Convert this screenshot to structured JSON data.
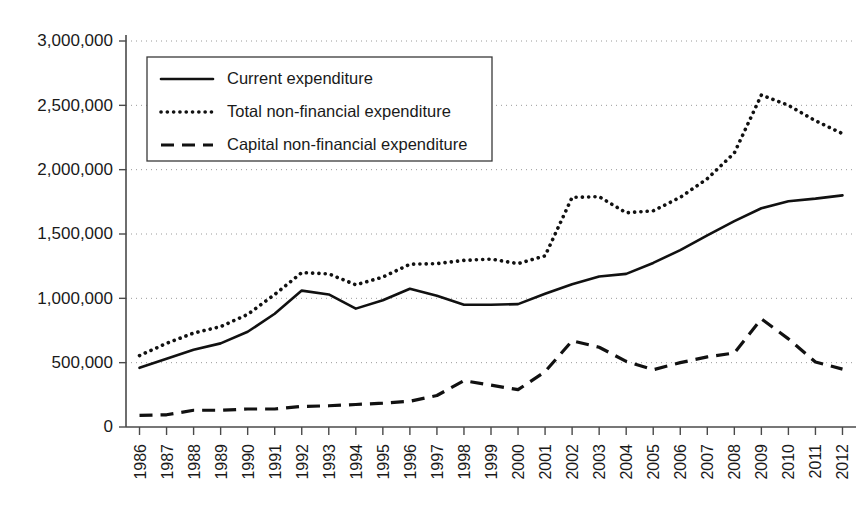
{
  "chart_data": {
    "type": "line",
    "title": "",
    "xlabel": "",
    "ylabel": "",
    "ylim": [
      0,
      3000000
    ],
    "grid": true,
    "legend_position": "top-left",
    "categories": [
      "1986",
      "1987",
      "1988",
      "1989",
      "1990",
      "1991",
      "1992",
      "1993",
      "1994",
      "1995",
      "1996",
      "1997",
      "1998",
      "1999",
      "2000",
      "2001",
      "2002",
      "2003",
      "2004",
      "2005",
      "2006",
      "2007",
      "2008",
      "2009",
      "2010",
      "2011",
      "2012"
    ],
    "ytick_labels": [
      "0",
      "500,000",
      "1,000,000",
      "1,500,000",
      "2,000,000",
      "2,500,000",
      "3,000,000"
    ],
    "ytick_values": [
      0,
      500000,
      1000000,
      1500000,
      2000000,
      2500000,
      3000000
    ],
    "series": [
      {
        "name": "Current expenditure",
        "style": "solid",
        "values": [
          460000,
          530000,
          600000,
          650000,
          740000,
          880000,
          1060000,
          1030000,
          920000,
          985000,
          1075000,
          1020000,
          950000,
          950000,
          955000,
          1035000,
          1110000,
          1170000,
          1190000,
          1275000,
          1375000,
          1490000,
          1600000,
          1700000,
          1755000,
          1775000,
          1800000
        ]
      },
      {
        "name": "Total non-financial expenditure",
        "style": "dotted",
        "values": [
          555000,
          650000,
          730000,
          780000,
          875000,
          1030000,
          1200000,
          1190000,
          1105000,
          1165000,
          1265000,
          1270000,
          1295000,
          1305000,
          1270000,
          1330000,
          1785000,
          1790000,
          1665000,
          1680000,
          1785000,
          1930000,
          2130000,
          2580000,
          2500000,
          2380000,
          2280000
        ]
      },
      {
        "name": "Capital non-financial expenditure",
        "style": "dashed",
        "values": [
          90000,
          95000,
          130000,
          130000,
          140000,
          140000,
          160000,
          165000,
          175000,
          185000,
          200000,
          245000,
          360000,
          325000,
          290000,
          430000,
          670000,
          620000,
          510000,
          445000,
          500000,
          545000,
          575000,
          840000,
          685000,
          505000,
          450000
        ]
      }
    ]
  },
  "legend": {
    "items": [
      {
        "label": "Current expenditure",
        "style": "solid"
      },
      {
        "label": "Total non-financial expenditure",
        "style": "dotted"
      },
      {
        "label": "Capital non-financial expenditure",
        "style": "dashed"
      }
    ]
  }
}
